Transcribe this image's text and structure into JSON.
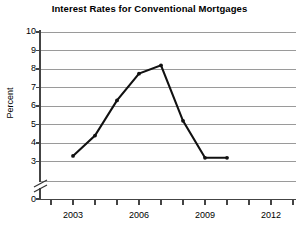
{
  "chart_data": {
    "type": "line",
    "title": "Interest Rates for Conventional Mortgages",
    "xlabel": "",
    "ylabel": "Percent",
    "grid": true,
    "legend": false,
    "axis_break": true,
    "axis_break_note": "y-axis broken between 0 and 3",
    "ylim": [
      0,
      10
    ],
    "yticks": [
      0,
      3,
      4,
      5,
      6,
      7,
      8,
      9,
      10
    ],
    "ytick_labels": [
      "0",
      "3",
      "4",
      "5",
      "6",
      "7",
      "8",
      "9",
      "10"
    ],
    "xlim": [
      2002,
      2013
    ],
    "xticks": [
      2002,
      2003,
      2004,
      2005,
      2006,
      2007,
      2008,
      2009,
      2010,
      2011,
      2012,
      2013
    ],
    "xtick_labels": [
      "",
      "2003",
      "",
      "",
      "2006",
      "",
      "",
      "2009",
      "",
      "",
      "2012",
      ""
    ],
    "x": [
      2003,
      2004,
      2005,
      2006,
      2007,
      2008,
      2009,
      2010
    ],
    "values": [
      3.3,
      4.4,
      6.3,
      7.75,
      8.2,
      5.2,
      3.2,
      3.2
    ],
    "series": [
      {
        "name": "Interest Rate",
        "color": "#111111",
        "x": [
          2003,
          2004,
          2005,
          2006,
          2007,
          2008,
          2009,
          2010
        ],
        "values": [
          3.3,
          4.4,
          6.3,
          7.75,
          8.2,
          5.2,
          3.2,
          3.2
        ]
      }
    ],
    "colors": {
      "line": "#111111",
      "grid": "#9a9a9a",
      "axis": "#444444",
      "text": "#000000",
      "background": "#ffffff"
    }
  },
  "ytick_positions": {
    "0": 199,
    "3": 161.5,
    "4": 143,
    "5": 124.5,
    "6": 106,
    "7": 87.5,
    "8": 69,
    "9": 50.5,
    "10": 32
  },
  "xtick_positions": {
    "2002": 51,
    "2003": 73,
    "2004": 95,
    "2005": 117,
    "2006": 139,
    "2007": 161,
    "2008": 183,
    "2009": 205,
    "2010": 227,
    "2011": 249,
    "2012": 271,
    "2013": 293
  }
}
